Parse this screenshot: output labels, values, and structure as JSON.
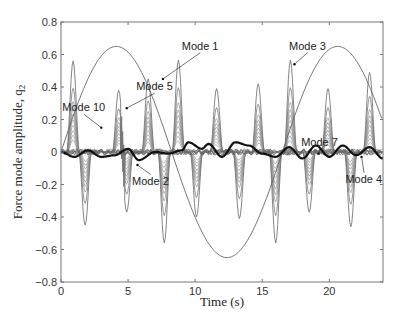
{
  "chart_data": {
    "type": "line",
    "title": "",
    "xlabel": "Time (s)",
    "ylabel": "Force mode amplitude, q",
    "ylabel_subscript": "2",
    "xlim": [
      0,
      24
    ],
    "ylim": [
      -0.8,
      0.8
    ],
    "xticks": [
      0,
      5,
      10,
      15,
      20
    ],
    "yticks": [
      -0.8,
      -0.6,
      -0.4,
      -0.2,
      0,
      0.2,
      0.4,
      0.6,
      0.8
    ],
    "xtick_labels": [
      "0",
      "5",
      "10",
      "15",
      "20"
    ],
    "ytick_labels": [
      "−0.8",
      "−0.6",
      "−0.4",
      "−0.2",
      "0",
      "0.2",
      "0.4",
      "0.6",
      "0.8"
    ],
    "grid": false,
    "legend": "none (inline annotations)",
    "series": [
      {
        "name": "Mode 1",
        "description": "slow sinusoid, period ~16.5 s, amplitude ~0.65",
        "x": [
          0,
          2,
          4,
          6,
          8.3,
          10.3,
          12.3,
          14.3,
          16.5,
          18.5,
          20.5,
          22.5,
          24
        ],
        "values": [
          0.0,
          0.45,
          0.65,
          0.45,
          0.0,
          -0.46,
          -0.65,
          -0.46,
          0.0,
          0.46,
          0.65,
          0.46,
          0.22
        ]
      },
      {
        "name": "Mode 3",
        "description": "sharp alternating pulses (largest envelope)",
        "peaks": [
          {
            "x": 0.9,
            "y": 0.56
          },
          {
            "x": 1.8,
            "y": -0.45
          },
          {
            "x": 4.3,
            "y": 0.38
          },
          {
            "x": 4.9,
            "y": -0.37
          },
          {
            "x": 6.5,
            "y": 0.45
          },
          {
            "x": 7.7,
            "y": -0.56
          },
          {
            "x": 8.75,
            "y": 0.565
          },
          {
            "x": 10.1,
            "y": -0.4
          },
          {
            "x": 11.6,
            "y": 0.39
          },
          {
            "x": 13.3,
            "y": -0.41
          },
          {
            "x": 14.7,
            "y": 0.42
          },
          {
            "x": 16.0,
            "y": -0.56
          },
          {
            "x": 17.1,
            "y": 0.565
          },
          {
            "x": 18.5,
            "y": -0.37
          },
          {
            "x": 19.9,
            "y": 0.39
          },
          {
            "x": 21.6,
            "y": -0.46
          },
          {
            "x": 23.0,
            "y": 0.49
          }
        ]
      },
      {
        "name": "Mode 2",
        "description": "thick black low-amplitude oscillation around zero",
        "x": [
          0,
          1,
          2,
          3,
          4,
          5,
          5.8,
          7,
          8,
          9,
          9.5,
          10.5,
          11,
          12,
          13,
          14,
          15,
          16,
          17,
          18,
          19,
          20,
          21,
          22,
          23,
          24
        ],
        "values": [
          0.0,
          -0.03,
          0.01,
          -0.03,
          -0.02,
          0.02,
          -0.05,
          0.0,
          -0.01,
          0.01,
          0.06,
          0.02,
          0.05,
          -0.03,
          0.06,
          0.04,
          -0.01,
          -0.03,
          0.03,
          -0.04,
          0.04,
          -0.03,
          0.04,
          -0.02,
          0.03,
          -0.04
        ]
      },
      {
        "name": "Mode 4",
        "description": "intermediate nested pulse envelope"
      },
      {
        "name": "Mode 5",
        "description": "intermediate nested pulse envelope, peak ~0.38 near t=4.3"
      },
      {
        "name": "Mode 7",
        "description": "small amplitude envelope"
      },
      {
        "name": "Mode 10",
        "description": "small amplitude envelope near zero"
      }
    ],
    "annotations": [
      {
        "text": "Mode 1",
        "x": 9.0,
        "y": 0.63
      },
      {
        "text": "Mode 5",
        "x": 5.6,
        "y": 0.38
      },
      {
        "text": "Mode 10",
        "x": 0.1,
        "y": 0.25
      },
      {
        "text": "Mode 3",
        "x": 17.0,
        "y": 0.63
      },
      {
        "text": "Mode 7",
        "x": 17.9,
        "y": 0.04
      },
      {
        "text": "Mode 2",
        "x": 5.3,
        "y": -0.2
      },
      {
        "text": "Mode 4",
        "x": 21.2,
        "y": -0.19
      }
    ]
  }
}
